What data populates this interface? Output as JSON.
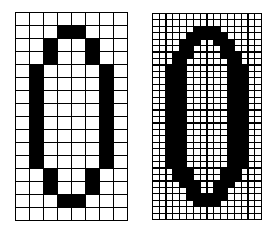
{
  "figures": [
    {
      "id": "low-res",
      "cols": 8,
      "rows": 16,
      "filled": {
        "1": [
          3,
          4
        ],
        "2": [
          2,
          5
        ],
        "3": [
          2,
          5
        ],
        "4": [
          1,
          6
        ],
        "5": [
          1,
          6
        ],
        "6": [
          1,
          6
        ],
        "7": [
          1,
          6
        ],
        "8": [
          1,
          6
        ],
        "9": [
          1,
          6
        ],
        "10": [
          1,
          6
        ],
        "11": [
          1,
          6
        ],
        "12": [
          2,
          5
        ],
        "13": [
          2,
          5
        ],
        "14": [
          3,
          4
        ]
      }
    },
    {
      "id": "high-res",
      "cols": 16,
      "rows": 32,
      "filled": {
        "2": [
          6,
          7,
          8,
          9
        ],
        "3": [
          5,
          6,
          7,
          8,
          9,
          10
        ],
        "4": [
          4,
          5,
          6,
          9,
          10,
          11
        ],
        "5": [
          4,
          5,
          10,
          11
        ],
        "6": [
          3,
          4,
          5,
          10,
          11,
          12
        ],
        "7": [
          3,
          4,
          11,
          12
        ],
        "8": [
          2,
          3,
          4,
          11,
          12,
          13
        ],
        "9": [
          2,
          3,
          4,
          11,
          12,
          13
        ],
        "10": [
          2,
          3,
          4,
          11,
          12,
          13
        ],
        "11": [
          2,
          3,
          4,
          11,
          12,
          13
        ],
        "12": [
          2,
          3,
          4,
          11,
          12,
          13
        ],
        "13": [
          2,
          3,
          4,
          11,
          12,
          13
        ],
        "14": [
          2,
          3,
          4,
          11,
          12,
          13
        ],
        "15": [
          2,
          3,
          4,
          11,
          12,
          13
        ],
        "16": [
          2,
          3,
          4,
          11,
          12,
          13
        ],
        "17": [
          2,
          3,
          4,
          11,
          12,
          13
        ],
        "18": [
          2,
          3,
          4,
          11,
          12,
          13
        ],
        "19": [
          2,
          3,
          4,
          11,
          12,
          13
        ],
        "20": [
          2,
          3,
          4,
          11,
          12,
          13
        ],
        "21": [
          2,
          3,
          4,
          11,
          12,
          13
        ],
        "22": [
          2,
          3,
          4,
          11,
          12,
          13
        ],
        "23": [
          2,
          3,
          4,
          11,
          12,
          13
        ],
        "24": [
          3,
          4,
          5,
          10,
          11,
          12
        ],
        "25": [
          3,
          4,
          5,
          10,
          11,
          12
        ],
        "26": [
          4,
          5,
          6,
          9,
          10,
          11
        ],
        "27": [
          5,
          6,
          9,
          10
        ],
        "28": [
          5,
          6,
          7,
          8,
          9,
          10
        ],
        "29": [
          6,
          7,
          8,
          9
        ]
      }
    }
  ]
}
